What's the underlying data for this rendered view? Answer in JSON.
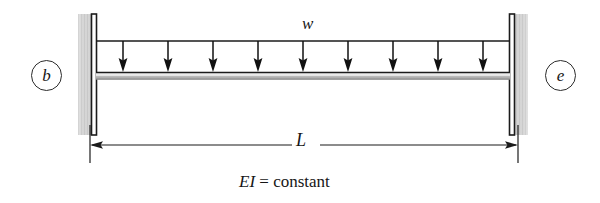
{
  "figure": {
    "background_color": "#ffffff",
    "width": 600,
    "height": 203
  },
  "labels": {
    "node_left": "b",
    "node_right": "e",
    "load_intensity": "w",
    "span": "L",
    "stiffness_prefix": "EI",
    "stiffness_equals": " = ",
    "stiffness_value": "constant",
    "stiffness_full": "EI = constant"
  },
  "beam": {
    "left_x": 96,
    "right_x": 510,
    "top_y": 72,
    "thickness": 7,
    "edge_color": "#1b1b1b",
    "body_color": "#d8d8d8",
    "shade_color": "#a8a8a8"
  },
  "load": {
    "type": "uniformly distributed",
    "line_y": 41,
    "arrow_count": 9,
    "arrow_x_positions": [
      123,
      168,
      213,
      258,
      303,
      348,
      393,
      438,
      483
    ],
    "arrow_tip_y": 71,
    "arrow_color": "#111111",
    "direction": "down"
  },
  "supports": {
    "type": "fixed",
    "color_hatch": "#d2d2d2",
    "color_bar": "#1b1b1b",
    "top_y": 14,
    "bottom_y": 135,
    "left": {
      "hatch_x": 78,
      "hatch_w": 14,
      "bar_x": 92
    },
    "right": {
      "hatch_x": 514,
      "hatch_w": 14,
      "bar_x": 510
    }
  },
  "dimension": {
    "line_y": 145,
    "left_x": 90,
    "right_x": 518,
    "extension_top_y": 125,
    "extension_bottom_y": 163,
    "color": "#1b1b1b",
    "arrowheads": "both"
  }
}
